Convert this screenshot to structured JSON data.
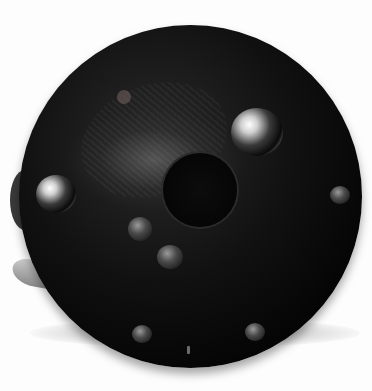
{
  "image": {
    "subject": "fishing reel back plate",
    "background_color": "#fdfdfd",
    "plate_color": "#0a0a0a",
    "elements": {
      "large_jewels": 2,
      "small_screws": 6,
      "center_hub": 1,
      "bottom_pin": 1
    }
  }
}
